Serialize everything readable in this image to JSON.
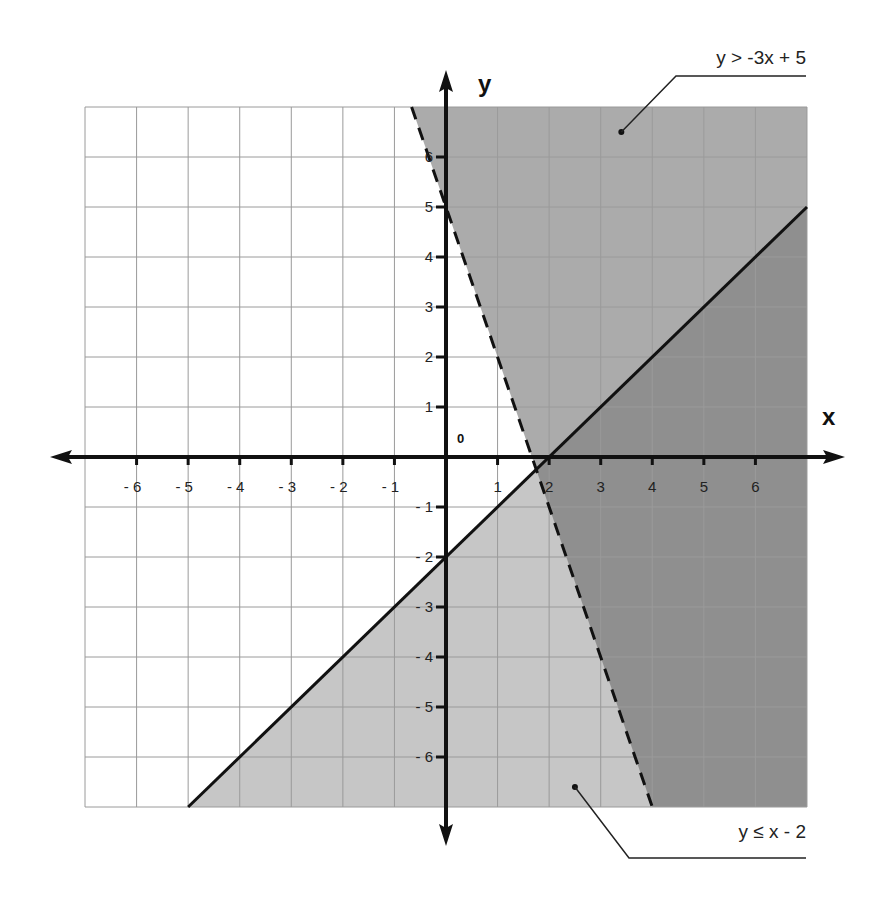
{
  "chart_data": {
    "type": "line",
    "title": "",
    "xlabel": "x",
    "ylabel": "y",
    "xlim": [
      -7,
      7
    ],
    "ylim": [
      -7,
      7
    ],
    "grid": true,
    "origin_label": "0",
    "x_ticks": [
      -6,
      -5,
      -4,
      -3,
      -2,
      -1,
      1,
      2,
      3,
      4,
      5,
      6
    ],
    "y_ticks": [
      -6,
      -5,
      -4,
      -3,
      -2,
      -1,
      1,
      2,
      3,
      4,
      5,
      6
    ],
    "x_tick_labels": [
      "- 6",
      "- 5",
      "- 4",
      "- 3",
      "- 2",
      "- 1",
      "1",
      "2",
      "3",
      "4",
      "5",
      "6"
    ],
    "y_tick_labels": [
      "- 6",
      "- 5",
      "- 4",
      "- 3",
      "- 2",
      "- 1",
      "1",
      "2",
      "3",
      "4",
      "5",
      "6"
    ],
    "series": [
      {
        "name": "y > -3x + 5",
        "inequality": ">",
        "slope": -3,
        "intercept": 5,
        "line_style": "dashed",
        "shading": "above",
        "points": [
          [
            -0.667,
            7
          ],
          [
            4,
            -7
          ]
        ]
      },
      {
        "name": "y ≤ x - 2",
        "inequality": "<=",
        "slope": 1,
        "intercept": -2,
        "line_style": "solid",
        "shading": "below",
        "points": [
          [
            -5,
            -7
          ],
          [
            7,
            5
          ]
        ]
      }
    ],
    "intersection": [
      1.75,
      -0.25
    ],
    "annotations": [
      {
        "text": "y > -3x + 5",
        "target": [
          3.4,
          6.5
        ],
        "position": "top-right"
      },
      {
        "text": "y ≤ x - 2",
        "target": [
          2.5,
          -6.6
        ],
        "position": "bottom-right"
      }
    ]
  },
  "colors": {
    "background": "#ffffff",
    "grid_line": "#9a9a9a",
    "axis": "#111111",
    "region_above_dashed": "#ababab",
    "region_below_solid": "#c6c6c6",
    "region_overlap": "#8f8f8f"
  },
  "labels": {
    "x_axis": "x",
    "y_axis": "y",
    "origin": "0",
    "annotation_top": "y > -3x + 5",
    "annotation_bottom_prefix": "y ",
    "annotation_bottom_symbol": "≤",
    "annotation_bottom_suffix": " x - 2"
  }
}
